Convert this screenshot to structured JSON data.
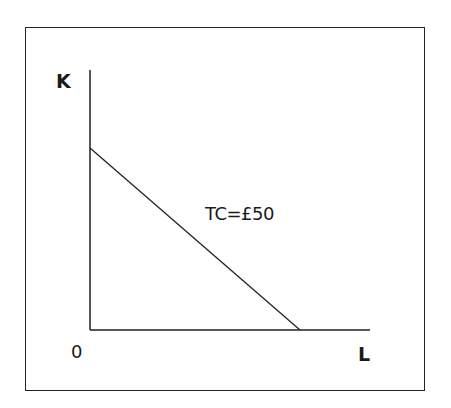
{
  "diagram": {
    "y_axis_label": "K",
    "x_axis_label": "L",
    "origin_label": "0",
    "line_label": "TC=£50",
    "line": {
      "type": "isocost",
      "k_intercept_fraction_of_axis": 0.7,
      "l_intercept_fraction_of_axis": 0.75
    },
    "colors": {
      "stroke": "#222222",
      "background": "#ffffff"
    }
  }
}
